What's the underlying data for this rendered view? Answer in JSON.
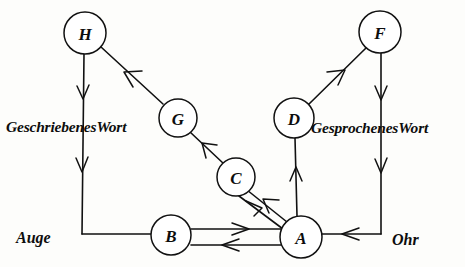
{
  "figure": {
    "kind": "neurological-language-model-diagram",
    "background_color": "#fdfdfb",
    "ink_color": "#111111",
    "width": 465,
    "height": 267
  },
  "nodes": [
    {
      "id": "H",
      "label": "H",
      "cx": 85,
      "cy": 33,
      "r": 21
    },
    {
      "id": "F",
      "label": "F",
      "cx": 380,
      "cy": 32,
      "r": 21
    },
    {
      "id": "G",
      "label": "G",
      "cx": 178,
      "cy": 118,
      "r": 19
    },
    {
      "id": "D",
      "label": "D",
      "cx": 294,
      "cy": 118,
      "r": 20
    },
    {
      "id": "C",
      "label": "C",
      "cx": 236,
      "cy": 177,
      "r": 19
    },
    {
      "id": "B",
      "label": "B",
      "cx": 171,
      "cy": 235,
      "r": 20
    },
    {
      "id": "A",
      "label": "A",
      "cx": 301,
      "cy": 237,
      "r": 21
    }
  ],
  "labels": {
    "written_word": "GeschriebenesWort",
    "spoken_word": "GesprochenesWort",
    "eye": "Auge",
    "ear": "Ohr"
  },
  "edges": [
    {
      "id": "H-auge",
      "from": "H",
      "to": "Auge",
      "direction": "down",
      "arrows": 2
    },
    {
      "id": "G-H",
      "from": "G",
      "to": "H",
      "direction": "up-left",
      "arrows": 1
    },
    {
      "id": "C-G",
      "from": "C",
      "to": "G",
      "direction": "up-left",
      "arrows": 1
    },
    {
      "id": "A-C",
      "from": "A",
      "to": "C",
      "direction": "up-left",
      "arrows": 1
    },
    {
      "id": "C-A",
      "from": "C",
      "to": "A",
      "direction": "down-right",
      "arrows": 1
    },
    {
      "id": "B-A",
      "from": "B",
      "to": "A",
      "direction": "right",
      "arrows": 1
    },
    {
      "id": "A-B",
      "from": "A",
      "to": "B",
      "direction": "left",
      "arrows": 1
    },
    {
      "id": "auge-B",
      "from": "Auge",
      "to": "B",
      "direction": "right",
      "arrows": 0
    },
    {
      "id": "A-D",
      "from": "A",
      "to": "D",
      "direction": "up",
      "arrows": 1
    },
    {
      "id": "D-F",
      "from": "D",
      "to": "F",
      "direction": "up-right",
      "arrows": 1
    },
    {
      "id": "F-ohr",
      "from": "F",
      "to": "Ohr",
      "direction": "down",
      "arrows": 2
    },
    {
      "id": "ohr-A",
      "from": "Ohr",
      "to": "A",
      "direction": "left",
      "arrows": 1
    }
  ]
}
